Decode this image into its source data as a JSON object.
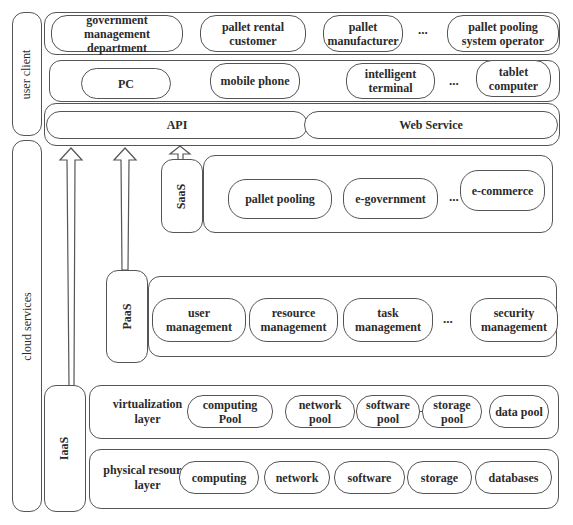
{
  "side_labels": {
    "user_client": "user client",
    "cloud_services": "cloud services"
  },
  "user_row": {
    "items": [
      "government management department",
      "pallet rental customer",
      "pallet manufacturer",
      "pallet pooling system operator"
    ],
    "ellipsis": "..."
  },
  "device_row": {
    "items": [
      "PC",
      "mobile phone",
      "intelligent terminal",
      "tablet computer"
    ],
    "ellipsis": "..."
  },
  "interface_row": {
    "api": "API",
    "web_service": "Web Service"
  },
  "saas": {
    "label": "SaaS",
    "items": [
      "pallet pooling",
      "e-government",
      "e-commerce"
    ],
    "ellipsis": "..."
  },
  "paas": {
    "label": "PaaS",
    "items": [
      "user management",
      "resource management",
      "task management",
      "security management"
    ],
    "ellipsis": "..."
  },
  "iaas": {
    "label": "IaaS",
    "virtualization_layer": {
      "label": "virtualization layer",
      "items": [
        "computing Pool",
        "network pool",
        "software pool",
        "storage pool",
        "data pool"
      ]
    },
    "physical_layer": {
      "label": "physical resource layer",
      "items": [
        "computing",
        "network",
        "software",
        "storage",
        "databases"
      ]
    }
  }
}
